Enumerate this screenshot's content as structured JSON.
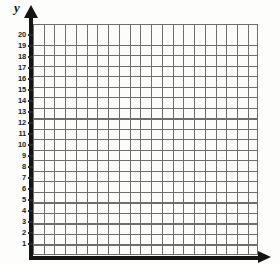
{
  "document": {
    "title": "Blank coordinate grid worksheet",
    "background_color": "#fdfdfb"
  },
  "axes": {
    "y_axis": {
      "label": "y",
      "arrow_icon": "arrow-up-icon",
      "color": "#141414"
    },
    "x_axis": {
      "label": "",
      "arrow_icon": "arrow-right-icon",
      "color": "#141414"
    }
  },
  "grid": {
    "line_color": "#6e6e6e",
    "cell_size_px": 10.6,
    "columns": 21,
    "rows": 22
  },
  "chart_data": {
    "type": "scatter",
    "title": "",
    "xlabel": "",
    "ylabel": "y",
    "x": [],
    "y": [],
    "series": [],
    "xlim": [
      0,
      21
    ],
    "ylim": [
      0,
      21
    ],
    "grid": true,
    "legend": null,
    "y_tick_labels": [
      "20",
      "19",
      "18",
      "17",
      "16",
      "15",
      "14",
      "13",
      "12",
      "11",
      "10",
      "9",
      "8",
      "7",
      "6",
      "5",
      "4",
      "3",
      "2",
      "1"
    ],
    "y_tick_values": [
      20,
      19,
      18,
      17,
      16,
      15,
      14,
      13,
      12,
      11,
      10,
      9,
      8,
      7,
      6,
      5,
      4,
      3,
      2,
      1
    ],
    "x_tick_labels": [],
    "annotations": []
  }
}
